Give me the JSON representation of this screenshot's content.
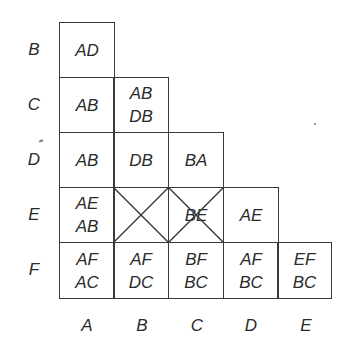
{
  "diagram": {
    "type": "lower-triangular pair table (implication chart)",
    "row_labels": [
      "B",
      "C",
      "D",
      "E",
      "F"
    ],
    "col_labels": [
      "A",
      "B",
      "C",
      "D",
      "E"
    ],
    "cells": {
      "B_A": {
        "lines": [
          "AD",
          ""
        ],
        "crossed": false
      },
      "C_A": {
        "lines": [
          "AB",
          ""
        ],
        "crossed": false
      },
      "C_B": {
        "lines": [
          "AB",
          "DB"
        ],
        "crossed": false
      },
      "D_A": {
        "lines": [
          "AB",
          ""
        ],
        "crossed": false
      },
      "D_B": {
        "lines": [
          "DB",
          ""
        ],
        "crossed": false
      },
      "D_C": {
        "lines": [
          "BA",
          ""
        ],
        "crossed": false
      },
      "E_A": {
        "lines": [
          "AE",
          "AB"
        ],
        "crossed": false
      },
      "E_B": {
        "lines": [
          "",
          ""
        ],
        "crossed": true
      },
      "E_C": {
        "lines": [
          "BE",
          ""
        ],
        "crossed": true
      },
      "E_D": {
        "lines": [
          "AE",
          ""
        ],
        "crossed": false
      },
      "F_A": {
        "lines": [
          "AF",
          "AC"
        ],
        "crossed": false
      },
      "F_B": {
        "lines": [
          "AF",
          "DC"
        ],
        "crossed": false
      },
      "F_C": {
        "lines": [
          "BF",
          "BC"
        ],
        "crossed": false
      },
      "F_D": {
        "lines": [
          "AF",
          "BC"
        ],
        "crossed": false
      },
      "F_E": {
        "lines": [
          "EF",
          "BC"
        ],
        "crossed": false
      }
    }
  }
}
